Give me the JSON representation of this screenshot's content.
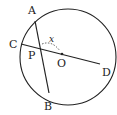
{
  "diagram": {
    "type": "geometry-circle-chords",
    "circle": {
      "center_label": "O",
      "cx": 68,
      "cy": 57,
      "r": 48
    },
    "points": {
      "A": {
        "label": "A",
        "x": 35,
        "y": 21
      },
      "B": {
        "label": "B",
        "x": 49,
        "y": 93
      },
      "C": {
        "label": "C",
        "x": 21,
        "y": 44
      },
      "D": {
        "label": "D",
        "x": 100,
        "y": 64
      },
      "P": {
        "label": "P",
        "x": 40,
        "y": 49
      },
      "O": {
        "label": "O",
        "x": 62,
        "y": 54
      }
    },
    "chords": [
      {
        "name": "AB",
        "from": "A",
        "to": "B"
      },
      {
        "name": "CD",
        "from": "C",
        "to": "D"
      }
    ],
    "angle": {
      "label": "x",
      "vertex": "P",
      "style": "dashed-arc"
    },
    "stroke_color": "#222222"
  }
}
